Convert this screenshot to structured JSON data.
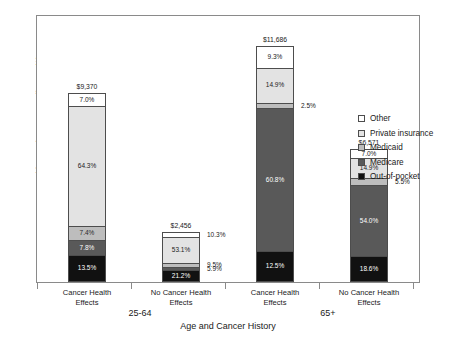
{
  "chart_data": {
    "type": "bar",
    "subtype": "stacked-percent",
    "title": "",
    "xlabel": "Age and Cancer History",
    "ylabel": "Health Services Expenditures ($)",
    "grid": false,
    "legend_position": "right",
    "ylim": [
      0,
      11686
    ],
    "categories": [
      "Cancer Health Effects",
      "No Cancer Health Effects",
      "Cancer Health Effects",
      "No Cancer Health Effects"
    ],
    "groups": [
      {
        "label": "25-64",
        "categories": [
          0,
          1
        ]
      },
      {
        "label": "65+",
        "categories": [
          2,
          3
        ]
      }
    ],
    "totals": [
      9370,
      2456,
      11686,
      6571
    ],
    "total_labels": [
      "$9,370",
      "$2,456",
      "$11,686",
      "$6,571"
    ],
    "series": [
      {
        "name": "Other",
        "color": "#ffffff",
        "values": [
          7.0,
          10.3,
          9.3,
          7.0
        ],
        "labels": [
          "7.0%",
          "10.3%",
          "9.3%",
          "7.0%"
        ]
      },
      {
        "name": "Private insurance",
        "color": "#e3e3e3",
        "values": [
          64.3,
          53.1,
          14.9,
          14.9
        ],
        "labels": [
          "64.3%",
          "53.1%",
          "14.9%",
          "14.9%"
        ]
      },
      {
        "name": "Medicaid",
        "color": "#bdbdbd",
        "values": [
          7.4,
          9.5,
          2.5,
          5.5
        ],
        "labels": [
          "7.4%",
          "9.5%",
          "2.5%",
          "5.5%"
        ]
      },
      {
        "name": "Medicare",
        "color": "#595959",
        "values": [
          7.8,
          5.9,
          60.8,
          54.0
        ],
        "labels": [
          "7.8%",
          "5.9%",
          "60.8%",
          "54.0%"
        ]
      },
      {
        "name": "Out-of-pocket",
        "color": "#111111",
        "values": [
          13.5,
          21.2,
          12.5,
          18.6
        ],
        "labels": [
          "13.5%",
          "21.2%",
          "12.5%",
          "18.6%"
        ]
      }
    ]
  },
  "axes": {
    "y_title": "Health Services Expenditures ($)",
    "x_title": "Age and Cancer History"
  },
  "legend": {
    "items": [
      {
        "label": "Other"
      },
      {
        "label": "Private insurance"
      },
      {
        "label": "Medicaid"
      },
      {
        "label": "Medicare"
      },
      {
        "label": "Out-of-pocket"
      }
    ]
  },
  "bars": [
    {
      "total_label": "$9,370",
      "category_line1": "Cancer Health",
      "category_line2": "Effects",
      "segments": [
        {
          "label": "7.0%",
          "outside": false
        },
        {
          "label": "64.3%",
          "outside": false
        },
        {
          "label": "7.4%",
          "outside": false
        },
        {
          "label": "7.8%",
          "outside": false
        },
        {
          "label": "13.5%",
          "outside": false
        }
      ]
    },
    {
      "total_label": "$2,456",
      "category_line1": "No Cancer Health",
      "category_line2": "Effects",
      "segments": [
        {
          "label": "10.3%",
          "outside": true
        },
        {
          "label": "53.1%",
          "outside": false
        },
        {
          "label": "9.5%",
          "outside": true
        },
        {
          "label": "5.9%",
          "outside": true
        },
        {
          "label": "21.2%",
          "outside": false
        }
      ]
    },
    {
      "total_label": "$11,686",
      "category_line1": "Cancer Health",
      "category_line2": "Effects",
      "segments": [
        {
          "label": "9.3%",
          "outside": false
        },
        {
          "label": "14.9%",
          "outside": false
        },
        {
          "label": "2.5%",
          "outside": true
        },
        {
          "label": "60.8%",
          "outside": false
        },
        {
          "label": "12.5%",
          "outside": false
        }
      ]
    },
    {
      "total_label": "$6,571",
      "category_line1": "No Cancer Health",
      "category_line2": "Effects",
      "segments": [
        {
          "label": "7.0%",
          "outside": false
        },
        {
          "label": "14.9%",
          "outside": false
        },
        {
          "label": "5.5%",
          "outside": true
        },
        {
          "label": "54.0%",
          "outside": false
        },
        {
          "label": "18.6%",
          "outside": false
        }
      ]
    }
  ]
}
